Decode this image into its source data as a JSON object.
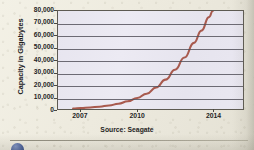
{
  "chart_data": {
    "type": "line",
    "title": "",
    "subtitle": "",
    "xlabel": "",
    "ylabel": "Capacity in Gigabytes",
    "source_note": "Source: Seagate",
    "grid": true,
    "legend": false,
    "legend_position": "none",
    "line_color": "#a85a4e",
    "plot_background": "#e9e7f1",
    "axis_color": "#5d5a52",
    "gridline_color": "#514e58",
    "xlim": [
      2005.8,
      2015.6
    ],
    "ylim": [
      0,
      80000
    ],
    "x_ticks": [
      2007,
      2010,
      2014
    ],
    "x_tick_labels": [
      "2007",
      "2010",
      "2014"
    ],
    "y_ticks": [
      0,
      10000,
      20000,
      30000,
      40000,
      50000,
      60000,
      70000,
      80000
    ],
    "y_tick_labels": [
      "0",
      "10,000",
      "20,000",
      "30,000",
      "40,000",
      "50,000",
      "60,000",
      "70,000",
      "80,000"
    ],
    "series": [
      {
        "name": "Hard drive capacity",
        "color": "#a85a4e",
        "x": [
          2006.6,
          2007.0,
          2007.5,
          2008.0,
          2008.5,
          2009.0,
          2009.5,
          2010.0,
          2010.5,
          2011.0,
          2011.5,
          2012.0,
          2012.5,
          2013.0,
          2013.4,
          2013.8,
          2014.0
        ],
        "y": [
          400,
          700,
          1200,
          1900,
          2900,
          4300,
          6300,
          9000,
          12500,
          17500,
          24000,
          32000,
          42000,
          54000,
          64000,
          75000,
          80000
        ]
      }
    ]
  },
  "footer": {
    "bullet_color": "#3f5795",
    "rule_color": "#a8a495"
  }
}
